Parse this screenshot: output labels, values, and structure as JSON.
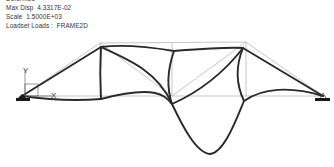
{
  "info": {
    "header_partial": "Deformed",
    "max_disp_label": "Max Disp",
    "max_disp_value": "4.3317E-02",
    "scale_label": "Scale",
    "scale_value": "1.5000E+03",
    "loadset_label": "Loadset Loads :",
    "loadset_value": "FRAME2D"
  },
  "axes": {
    "x_label": "X",
    "y_label": "Y"
  },
  "colors": {
    "deformed": "#2a2a2a",
    "undeformed": "#b8b8b8",
    "support": "#1a1a1a"
  },
  "icons": {
    "left_support": "fixed-support-icon",
    "right_support": "pin-support-icon",
    "coordinate_triad": "coordinate-axes-icon"
  }
}
